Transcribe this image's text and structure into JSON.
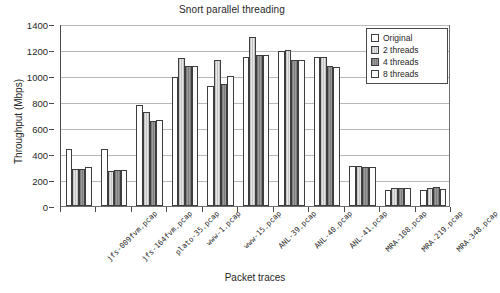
{
  "chart_data": {
    "type": "bar",
    "title": "Snort parallel threading",
    "xlabel": "Packet traces",
    "ylabel": "Throughput (Mbps)",
    "ylim": [
      0,
      1400
    ],
    "yticks": [
      0,
      200,
      400,
      600,
      800,
      1000,
      1200,
      1400
    ],
    "grid": true,
    "legend_position": "top-right",
    "categories": [
      "jfs-009fvm.pcap",
      "jfs-164fvm.pcap",
      "plato-35.pcap",
      "www-1.pcap",
      "www-15.pcap",
      "ANL-39.pcap",
      "ANL-40.pcap",
      "ANL-41.pcap",
      "MRA-108.pcap",
      "MRA-219.pcap",
      "MRA-348.pcap"
    ],
    "series": [
      {
        "name": "Original",
        "color": "#ffffff",
        "values": [
          440,
          435,
          775,
          995,
          920,
          1150,
          1195,
          1150,
          310,
          120,
          125
        ]
      },
      {
        "name": "2 threads",
        "color": "#cfcfcf",
        "values": [
          285,
          270,
          720,
          1140,
          1120,
          1300,
          1200,
          1150,
          305,
          135,
          140
        ]
      },
      {
        "name": "4 threads",
        "color": "#8d8d8d",
        "values": [
          285,
          280,
          655,
          1080,
          935,
          1160,
          1120,
          1080,
          300,
          135,
          145
        ]
      },
      {
        "name": "8 threads",
        "color": "#fbfbfb",
        "values": [
          300,
          280,
          665,
          1080,
          1000,
          1160,
          1120,
          1070,
          300,
          135,
          130
        ]
      }
    ]
  }
}
